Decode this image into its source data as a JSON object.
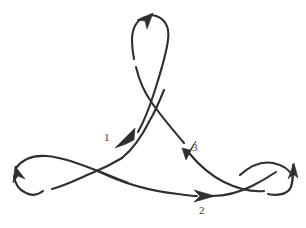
{
  "diagram": {
    "type": "knot-projection",
    "stroke_color": "#2e2e33",
    "background_color": "#ffffff",
    "label_color": "#3b3b40",
    "crossing_labels": [
      {
        "id": "crossing-1",
        "text": "1",
        "x": 104,
        "y": 132
      },
      {
        "id": "crossing-2",
        "text": "2",
        "x": 199,
        "y": 205
      },
      {
        "id": "crossing-3",
        "text": "3",
        "x": 192,
        "y": 142
      }
    ],
    "orientation_arrows": [
      {
        "id": "arrow-crossing-1",
        "direction": "down-left"
      },
      {
        "id": "arrow-crossing-2",
        "direction": "right"
      },
      {
        "id": "arrow-crossing-3",
        "direction": "down-left"
      },
      {
        "id": "arrow-top-loop",
        "direction": "up-right"
      },
      {
        "id": "arrow-left-loop",
        "direction": "up-right"
      },
      {
        "id": "arrow-right-loop",
        "direction": "up"
      }
    ],
    "strands": [
      {
        "id": "top-loop-right",
        "role": "over"
      },
      {
        "id": "top-loop-left",
        "role": "under"
      },
      {
        "id": "left-loop-upper",
        "role": "over"
      },
      {
        "id": "left-loop-lower",
        "role": "under"
      },
      {
        "id": "right-loop-upper",
        "role": "under"
      },
      {
        "id": "right-loop-lower",
        "role": "over"
      },
      {
        "id": "center-left-diagonal",
        "role": "over"
      },
      {
        "id": "center-right-diagonal",
        "role": "over"
      },
      {
        "id": "bottom-span",
        "role": "over"
      }
    ]
  }
}
